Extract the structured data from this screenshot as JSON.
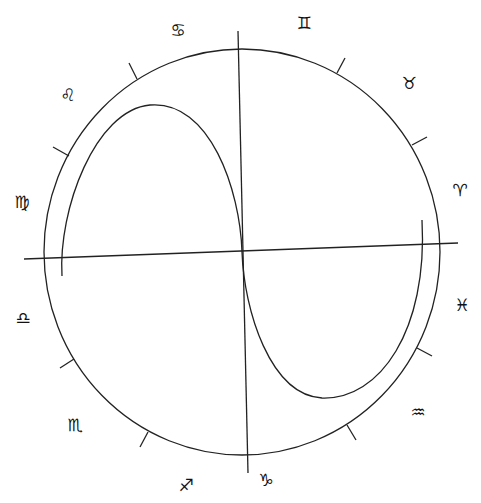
{
  "diagram": {
    "title": "",
    "type": "zodiac-circle-with-curve",
    "colors": {
      "line": "#222222",
      "glyph": "#111111",
      "background": "#ffffff"
    },
    "circle": {
      "cx": 242,
      "cy": 252,
      "rx": 198,
      "ry": 203
    },
    "axes": {
      "vertical": {
        "x1": 238,
        "y1": 31,
        "x2": 248,
        "y2": 473
      },
      "horizontal": {
        "x1": 24,
        "y1": 259,
        "x2": 458,
        "y2": 243
      }
    },
    "curve": {
      "description": "S-shaped curve passing through the center, looping upper-left and lower-right",
      "path": "M 62 276 C 58 210, 95 110, 150 105 C 210 100, 240 190, 242 252 C 244 310, 270 395, 322 398 C 380 400, 428 330, 422 220"
    },
    "ticks": [
      {
        "x1": 137,
        "y1": 79,
        "x2": 129,
        "y2": 63
      },
      {
        "x1": 69,
        "y1": 156,
        "x2": 53,
        "y2": 147
      },
      {
        "x1": 337,
        "y1": 73,
        "x2": 345,
        "y2": 58
      },
      {
        "x1": 412,
        "y1": 145,
        "x2": 427,
        "y2": 137
      },
      {
        "x1": 417,
        "y1": 348,
        "x2": 432,
        "y2": 356
      },
      {
        "x1": 347,
        "y1": 425,
        "x2": 356,
        "y2": 440
      },
      {
        "x1": 148,
        "y1": 432,
        "x2": 140,
        "y2": 447
      },
      {
        "x1": 74,
        "y1": 359,
        "x2": 60,
        "y2": 368
      }
    ],
    "signs": [
      {
        "name": "cancer",
        "symbol": "♋",
        "x": 178,
        "y": 30
      },
      {
        "name": "leo",
        "symbol": "♌",
        "x": 68,
        "y": 95
      },
      {
        "name": "virgo",
        "symbol": "♍",
        "x": 22,
        "y": 202
      },
      {
        "name": "libra",
        "symbol": "♎",
        "x": 23,
        "y": 318
      },
      {
        "name": "scorpio",
        "symbol": "♏",
        "x": 75,
        "y": 425
      },
      {
        "name": "sagittarius",
        "symbol": "♐",
        "x": 186,
        "y": 485
      },
      {
        "name": "capricorn",
        "symbol": "♑",
        "x": 266,
        "y": 480
      },
      {
        "name": "aquarius",
        "symbol": "♒",
        "x": 418,
        "y": 412
      },
      {
        "name": "pisces",
        "symbol": "♓",
        "x": 462,
        "y": 305
      },
      {
        "name": "aries",
        "symbol": "♈",
        "x": 460,
        "y": 190
      },
      {
        "name": "taurus",
        "symbol": "♉",
        "x": 409,
        "y": 83
      },
      {
        "name": "gemini",
        "symbol": "♊",
        "x": 304,
        "y": 23
      }
    ]
  }
}
